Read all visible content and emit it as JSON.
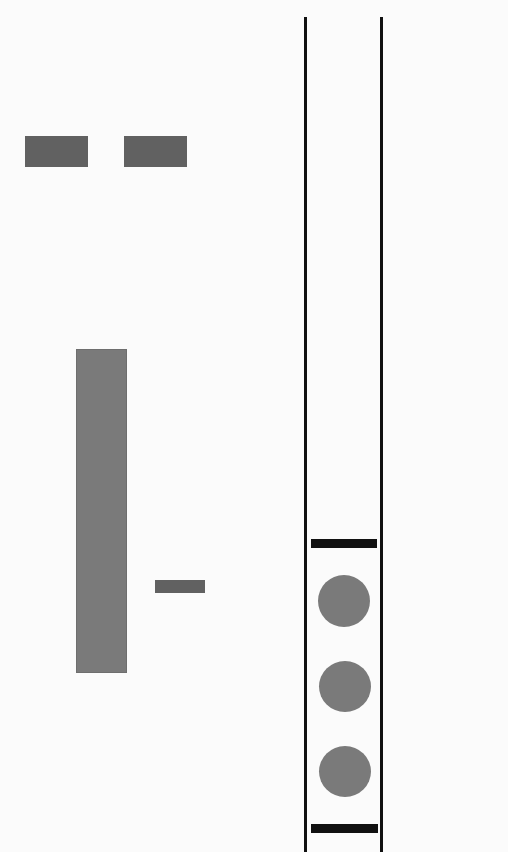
{
  "artwork": {
    "description": "Abstract geometric composition: gray rectangles on the left, a vertical channel of two black lines on the right containing two horizontal black bars and three gray circles",
    "colors": {
      "background": "#fbfbfb",
      "dark_gray": "#616161",
      "mid_gray": "#7a7a7a",
      "black": "#111111"
    },
    "elements": {
      "top_rectangles": 2,
      "tall_bar": 1,
      "small_bar": 1,
      "vertical_lines": 2,
      "horizontal_bars": 2,
      "circles": 3
    }
  }
}
